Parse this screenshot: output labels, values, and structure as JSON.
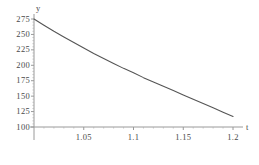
{
  "chart_data": {
    "type": "line",
    "title": "",
    "subtitle": "",
    "xlabel": "t",
    "ylabel": "y",
    "grid": false,
    "legend": false,
    "legend_position": "none",
    "axis_color": "#808080",
    "curve_color": "#555555",
    "background": "#ffffff",
    "xlim": [
      1.0,
      1.205
    ],
    "ylim": [
      86,
      280
    ],
    "x_axis_crosses_y_at": 100,
    "y_axis_crosses_x_at": 1.0,
    "xticks": [
      1.05,
      1.1,
      1.15,
      1.2
    ],
    "xtick_labels": [
      "1.05",
      "1.1",
      "1.15",
      "1.2"
    ],
    "yticks": [
      100,
      125,
      150,
      175,
      200,
      225,
      250,
      275
    ],
    "ytick_labels": [
      "100",
      "125",
      "150",
      "175",
      "200",
      "225",
      "250",
      "275"
    ],
    "x": [
      1.0,
      1.01,
      1.02,
      1.03,
      1.04,
      1.05,
      1.06,
      1.07,
      1.08,
      1.09,
      1.1,
      1.11,
      1.12,
      1.13,
      1.14,
      1.15,
      1.16,
      1.17,
      1.18,
      1.19,
      1.2
    ],
    "y": [
      275,
      265,
      255,
      246,
      237,
      228,
      219,
      211,
      203,
      195,
      188,
      180,
      173,
      166,
      159,
      152,
      145,
      138,
      131,
      124,
      117
    ],
    "series": [
      {
        "name": "curve",
        "values": [
          275,
          265,
          255,
          246,
          237,
          228,
          219,
          211,
          203,
          195,
          188,
          180,
          173,
          166,
          159,
          152,
          145,
          138,
          131,
          124,
          117
        ]
      }
    ],
    "annotations": []
  },
  "axes": {
    "x_name": "t",
    "y_name": "y"
  }
}
